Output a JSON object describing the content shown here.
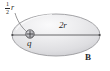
{
  "figure": {
    "type": "physics-diagram",
    "surface_label": "B",
    "labels": {
      "diameter": "2r",
      "charge": "q",
      "offset_numerator": "1",
      "offset_denominator": "2",
      "offset_unit": "r",
      "surface": "B"
    },
    "colors": {
      "ellipse_fill_light": "#f3f3f4",
      "ellipse_fill_mid": "#e2e2e4",
      "ellipse_fill_dark": "#d2d2d5",
      "ellipse_stroke": "#9a9a9d",
      "line_stroke": "#58585a",
      "charge_fill": "#b9b9bd",
      "charge_stroke": "#4a4a4c",
      "text": "#2b2b2b",
      "background": "#ffffff"
    },
    "geometry": {
      "ellipse_center_x": 56,
      "ellipse_center_y": 35,
      "ellipse_radius_x": 44,
      "ellipse_radius_y": 21,
      "charge_center_x": 30,
      "charge_center_y": 34,
      "charge_radius": 4.2,
      "diameter_left_x": 12,
      "diameter_right_x": 100,
      "diameter_y": 35
    }
  }
}
